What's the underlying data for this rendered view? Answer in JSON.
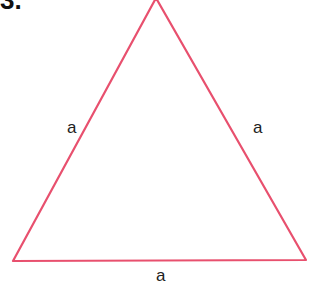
{
  "figure": {
    "number_label": "3.",
    "shape": "equilateral-triangle",
    "stroke_color": "#e8506e",
    "vertices": {
      "apex": [
        156,
        -2
      ],
      "bottom_left": [
        13,
        261
      ],
      "bottom_right": [
        306,
        260
      ]
    },
    "side_labels": {
      "left": "a",
      "right": "a",
      "bottom": "a"
    }
  }
}
